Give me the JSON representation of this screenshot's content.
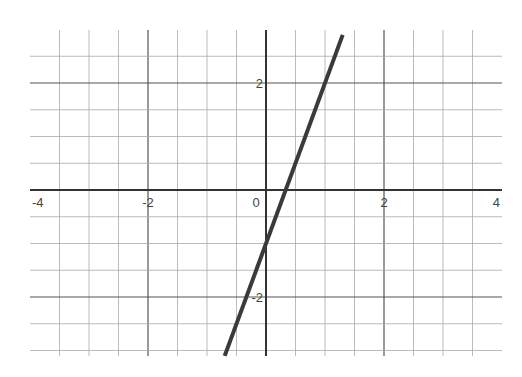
{
  "chart_data": {
    "type": "line",
    "title": "",
    "xlabel": "",
    "ylabel": "",
    "xlim": [
      -4,
      4
    ],
    "ylim": [
      -3.1,
      3.0
    ],
    "grid": true,
    "grid_step": 0.5,
    "x_ticks": [
      {
        "value": -4,
        "label": "-4"
      },
      {
        "value": -2,
        "label": "-2"
      },
      {
        "value": 0,
        "label": "0"
      },
      {
        "value": 2,
        "label": "2"
      },
      {
        "value": 4,
        "label": "4"
      }
    ],
    "y_ticks": [
      {
        "value": 2,
        "label": "2"
      },
      {
        "value": -2,
        "label": "-2"
      }
    ],
    "series": [
      {
        "name": "y = 3x - 1",
        "slope": 3,
        "intercept": -1,
        "x": [
          -0.7,
          1.3
        ],
        "y": [
          -3.1,
          2.9
        ],
        "color": "#3a3a3a"
      }
    ]
  },
  "colors": {
    "background": "#ffffff",
    "grid": "#aaaaaa",
    "axis": "#333333",
    "line": "#3a3a3a"
  }
}
